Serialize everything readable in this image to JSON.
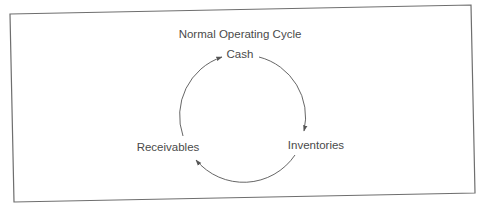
{
  "diagram": {
    "title": "Normal Operating Cycle",
    "nodes": [
      {
        "id": "cash",
        "label": "Cash"
      },
      {
        "id": "inventories",
        "label": "Inventories"
      },
      {
        "id": "receivables",
        "label": "Receivables"
      }
    ],
    "edges": [
      {
        "from": "cash",
        "to": "inventories"
      },
      {
        "from": "inventories",
        "to": "receivables"
      },
      {
        "from": "receivables",
        "to": "cash"
      }
    ],
    "colors": {
      "border": "#6e6e6e",
      "arrow": "#555555",
      "text": "#4a4a4a"
    }
  }
}
